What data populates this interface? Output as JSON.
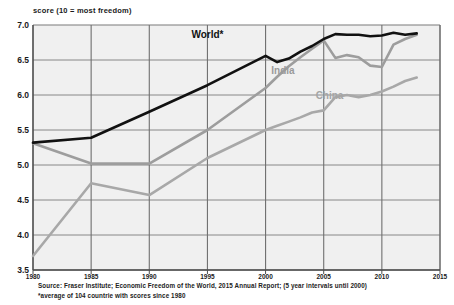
{
  "chart_data": {
    "type": "line",
    "title": "score (10 = most freedom)",
    "xlabel": "",
    "ylabel": "score (10 = most freedom)",
    "xlim": [
      1980,
      2015
    ],
    "ylim": [
      3.5,
      7.0
    ],
    "grid": true,
    "legend_position": "inline-labels",
    "y_ticks": [
      "7.0",
      "6.5",
      "6.0",
      "5.5",
      "5.0",
      "4.5",
      "4.0",
      "3.5"
    ],
    "y_tick_values": [
      7.0,
      6.5,
      6.0,
      5.5,
      5.0,
      4.5,
      4.0,
      3.5
    ],
    "x_ticks": [
      "1980",
      "1985",
      "1990",
      "1995",
      "2000",
      "2005",
      "2010",
      "2015"
    ],
    "x_tick_values": [
      1980,
      1985,
      1990,
      1995,
      2000,
      2005,
      2010,
      2015
    ],
    "series": [
      {
        "name": "World*",
        "color": "#111111",
        "label_x": 1995,
        "label_y": 6.82,
        "x": [
          1980,
          1985,
          1990,
          1995,
          2000,
          2001,
          2002,
          2003,
          2004,
          2005,
          2006,
          2007,
          2008,
          2009,
          2010,
          2011,
          2012,
          2013
        ],
        "values": [
          5.32,
          5.39,
          5.76,
          6.14,
          6.56,
          6.47,
          6.52,
          6.62,
          6.7,
          6.8,
          6.87,
          6.86,
          6.86,
          6.84,
          6.85,
          6.89,
          6.86,
          6.88
        ]
      },
      {
        "name": "India",
        "color": "#9d9d9d",
        "label_x": 2001.5,
        "label_y": 6.3,
        "x": [
          1980,
          1985,
          1990,
          1995,
          2000,
          2001,
          2002,
          2003,
          2004,
          2005,
          2006,
          2007,
          2008,
          2009,
          2010,
          2011,
          2012,
          2013
        ],
        "values": [
          5.31,
          5.02,
          5.02,
          5.5,
          6.1,
          6.26,
          6.41,
          6.54,
          6.66,
          6.78,
          6.53,
          6.57,
          6.54,
          6.42,
          6.4,
          6.72,
          6.8,
          6.86
        ]
      },
      {
        "name": "China",
        "color": "#a8a8a8",
        "label_x": 2005.5,
        "label_y": 5.95,
        "x": [
          1980,
          1985,
          1990,
          1995,
          2000,
          2001,
          2002,
          2003,
          2004,
          2005,
          2006,
          2007,
          2008,
          2009,
          2010,
          2011,
          2012,
          2013
        ],
        "values": [
          3.7,
          4.74,
          4.57,
          5.1,
          5.5,
          5.56,
          5.62,
          5.68,
          5.75,
          5.78,
          5.97,
          6.0,
          5.97,
          6.0,
          6.05,
          6.12,
          6.2,
          6.25
        ]
      }
    ],
    "annotations": [
      "Source: Fraser Institute; Economic Freedom of the World, 2015  Annual Report; (5 year intervals until 2000)",
      "*average of 104 countrie with scores  since 1980"
    ]
  },
  "source": {
    "line1": "Source: Fraser Institute;  Economic Freedom of the World, 2015  Annual Report; (5 year intervals until 2000)",
    "line2": "*average of 104 countrie with scores  since 1980"
  },
  "colors": {
    "world": "#111111",
    "india": "#9d9d9d",
    "china": "#a8a8a8",
    "plot_background": "#f0f0f0",
    "grid": "#7a7a7a",
    "axis": "#4d4d4d"
  }
}
